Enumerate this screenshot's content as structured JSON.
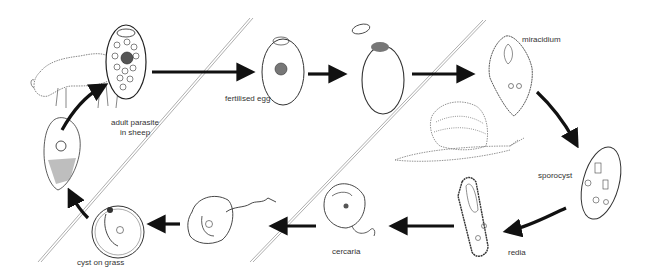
{
  "diagram": {
    "type": "life-cycle",
    "colors": {
      "ink": "#1a1a1a",
      "arrow": "#111111",
      "divider": "#9a9a9a",
      "background": "#ffffff"
    },
    "stages": [
      {
        "id": "adult",
        "label_line1": "adult parasite",
        "label_line2": "in sheep"
      },
      {
        "id": "egg",
        "label": "fertilised egg"
      },
      {
        "id": "hatching-egg",
        "label": ""
      },
      {
        "id": "miracidium",
        "label": "miracidium"
      },
      {
        "id": "sporocyst",
        "label": "sporocyst"
      },
      {
        "id": "redia",
        "label": "redia"
      },
      {
        "id": "cercaria",
        "label": "cercaria"
      },
      {
        "id": "encysting-cercaria",
        "label": ""
      },
      {
        "id": "cyst",
        "label": "cyst on grass"
      },
      {
        "id": "young-fluke",
        "label": ""
      }
    ],
    "hosts": [
      "sheep",
      "snail"
    ],
    "arrows": [
      {
        "from": "adult",
        "to": "egg"
      },
      {
        "from": "egg",
        "to": "hatching-egg"
      },
      {
        "from": "hatching-egg",
        "to": "miracidium"
      },
      {
        "from": "miracidium",
        "to": "sporocyst"
      },
      {
        "from": "sporocyst",
        "to": "redia"
      },
      {
        "from": "redia",
        "to": "cercaria"
      },
      {
        "from": "cercaria",
        "to": "encysting-cercaria"
      },
      {
        "from": "encysting-cercaria",
        "to": "cyst"
      },
      {
        "from": "cyst",
        "to": "young-fluke"
      },
      {
        "from": "young-fluke",
        "to": "adult"
      }
    ]
  }
}
